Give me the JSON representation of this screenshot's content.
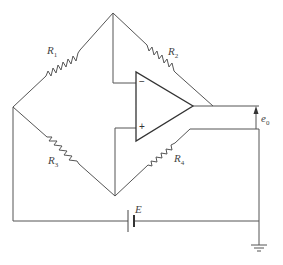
{
  "diagram": {
    "components": {
      "r1": {
        "symbol": "R",
        "sub": "1"
      },
      "r2": {
        "symbol": "R",
        "sub": "2"
      },
      "r3": {
        "symbol": "R",
        "sub": "3"
      },
      "r4": {
        "symbol": "R",
        "sub": "4"
      },
      "battery": {
        "label": "E"
      },
      "output": {
        "symbol": "e",
        "sub": "0"
      },
      "opamp": {
        "minus": "−",
        "plus": "+"
      }
    },
    "colors": {
      "line": "#555555",
      "background": "#ffffff"
    }
  }
}
